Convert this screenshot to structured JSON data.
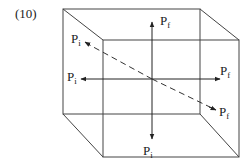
{
  "figure": {
    "number_label": "(10)",
    "colors": {
      "line": "#444444",
      "text": "#222222",
      "background": "#ffffff"
    }
  },
  "cube": {
    "back_face": {
      "top_left": [
        63,
        9
      ],
      "top_right": [
        200,
        9
      ],
      "bottom_right": [
        200,
        113
      ],
      "bottom_left": [
        63,
        114
      ]
    },
    "front_face": {
      "top_left": [
        103,
        40
      ],
      "top_right": [
        239,
        40
      ],
      "bottom_right": [
        239,
        157
      ],
      "bottom_left": [
        103,
        157
      ]
    }
  },
  "arrows": {
    "vertical": {
      "up": {
        "main": "P",
        "sub": "f"
      },
      "down": {
        "main": "P",
        "sub": "i"
      }
    },
    "horizontal": {
      "left": {
        "main": "P",
        "sub": "i"
      },
      "right": {
        "main": "P",
        "sub": "f"
      }
    },
    "diagonal_dashed": {
      "start": {
        "main": "P",
        "sub": "i"
      },
      "end": {
        "main": "P",
        "sub": "f"
      }
    }
  }
}
